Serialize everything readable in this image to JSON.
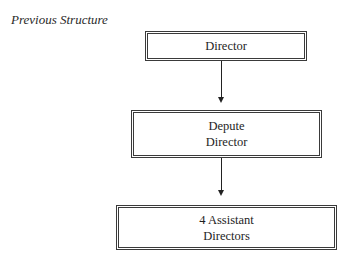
{
  "heading": "Previous Structure",
  "nodes": [
    {
      "id": "director",
      "lines": [
        "Director"
      ]
    },
    {
      "id": "depute-director",
      "lines": [
        "Depute",
        "Director"
      ]
    },
    {
      "id": "assistant-directors",
      "lines": [
        "4 Assistant",
        "Directors"
      ]
    }
  ],
  "edges": [
    {
      "from": "director",
      "to": "depute-director"
    },
    {
      "from": "depute-director",
      "to": "assistant-directors"
    }
  ]
}
